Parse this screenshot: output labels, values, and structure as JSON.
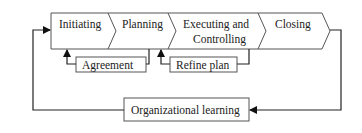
{
  "diagram": {
    "type": "process-flow",
    "phases": [
      {
        "id": "initiating",
        "label": "Initiating"
      },
      {
        "id": "planning",
        "label": "Planning"
      },
      {
        "id": "executing",
        "label_line1": "Executing and",
        "label_line2": "Controlling"
      },
      {
        "id": "closing",
        "label": "Closing"
      }
    ],
    "feedback_boxes": {
      "agreement": "Agreement",
      "refine_plan": "Refine plan",
      "organizational_learning": "Organizational learning"
    },
    "connections": [
      {
        "from": "planning",
        "to": "agreement"
      },
      {
        "from": "agreement",
        "to": "initiating"
      },
      {
        "from": "executing",
        "to": "refine_plan"
      },
      {
        "from": "refine_plan",
        "to": "planning"
      },
      {
        "from": "closing",
        "to": "organizational_learning"
      },
      {
        "from": "organizational_learning",
        "to": "initiating"
      }
    ]
  }
}
